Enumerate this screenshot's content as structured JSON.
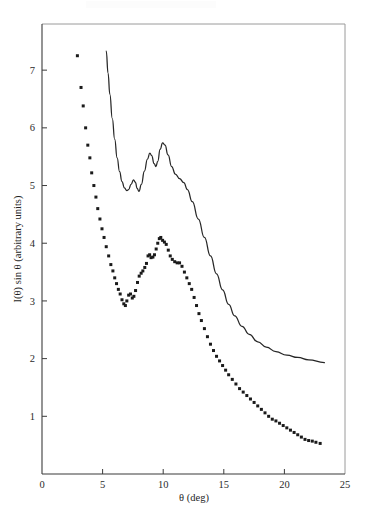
{
  "figure": {
    "background_color": "#ffffff",
    "ink_color": "#1a1a1a",
    "frame_color": "#9a9a9a"
  },
  "chart_data": {
    "type": "scatter",
    "title": "",
    "subtitle": "",
    "xlabel": "θ (deg)",
    "ylabel": "I(θ) sin θ (arbitrary units)",
    "xlim": [
      0,
      25
    ],
    "ylim": [
      0,
      7.8
    ],
    "xticks": [
      0,
      5,
      10,
      15,
      20,
      25
    ],
    "xticklabels": [
      "0",
      "5",
      "10",
      "15",
      "20",
      "25"
    ],
    "yticks": [
      1,
      2,
      3,
      4,
      5,
      6,
      7
    ],
    "yticklabels": [
      "1",
      "2",
      "3",
      "4",
      "5",
      "6",
      "7"
    ],
    "grid": false,
    "legend": null,
    "legend_position": "none",
    "annotations": [],
    "series": [
      {
        "name": "calculated curve",
        "style": "line",
        "marker": "none",
        "color": "#262626",
        "points": [
          [
            5.3,
            7.33
          ],
          [
            5.45,
            6.95
          ],
          [
            5.6,
            6.58
          ],
          [
            5.8,
            6.16
          ],
          [
            6.0,
            5.8
          ],
          [
            6.2,
            5.48
          ],
          [
            6.4,
            5.24
          ],
          [
            6.6,
            5.07
          ],
          [
            6.8,
            4.96
          ],
          [
            7.0,
            4.91
          ],
          [
            7.15,
            4.93
          ],
          [
            7.35,
            5.02
          ],
          [
            7.55,
            5.1
          ],
          [
            7.7,
            5.06
          ],
          [
            7.85,
            4.95
          ],
          [
            8.0,
            4.9
          ],
          [
            8.2,
            5.02
          ],
          [
            8.45,
            5.25
          ],
          [
            8.7,
            5.46
          ],
          [
            8.9,
            5.56
          ],
          [
            9.05,
            5.52
          ],
          [
            9.25,
            5.38
          ],
          [
            9.4,
            5.33
          ],
          [
            9.55,
            5.42
          ],
          [
            9.75,
            5.63
          ],
          [
            9.95,
            5.74
          ],
          [
            10.15,
            5.7
          ],
          [
            10.4,
            5.53
          ],
          [
            10.7,
            5.33
          ],
          [
            11.0,
            5.2
          ],
          [
            11.35,
            5.12
          ],
          [
            11.7,
            5.05
          ],
          [
            12.0,
            4.93
          ],
          [
            12.4,
            4.72
          ],
          [
            12.9,
            4.42
          ],
          [
            13.4,
            4.1
          ],
          [
            13.9,
            3.78
          ],
          [
            14.4,
            3.47
          ],
          [
            14.9,
            3.19
          ],
          [
            15.4,
            2.94
          ],
          [
            15.9,
            2.74
          ],
          [
            16.5,
            2.56
          ],
          [
            17.1,
            2.42
          ],
          [
            17.8,
            2.29
          ],
          [
            18.5,
            2.2
          ],
          [
            19.3,
            2.12
          ],
          [
            20.2,
            2.06
          ],
          [
            21.1,
            2.02
          ],
          [
            22.0,
            1.98
          ],
          [
            23.3,
            1.93
          ]
        ]
      },
      {
        "name": "experimental data",
        "style": "scatter",
        "marker": "square",
        "color": "#1a1a1a",
        "points": [
          [
            2.92,
            7.25
          ],
          [
            3.22,
            6.7
          ],
          [
            3.4,
            6.38
          ],
          [
            3.6,
            6.0
          ],
          [
            3.78,
            5.7
          ],
          [
            3.95,
            5.48
          ],
          [
            4.1,
            5.22
          ],
          [
            4.28,
            5.0
          ],
          [
            4.45,
            4.8
          ],
          [
            4.6,
            4.6
          ],
          [
            4.78,
            4.42
          ],
          [
            4.95,
            4.25
          ],
          [
            5.12,
            4.1
          ],
          [
            5.3,
            3.94
          ],
          [
            5.5,
            3.78
          ],
          [
            5.68,
            3.63
          ],
          [
            5.85,
            3.52
          ],
          [
            6.0,
            3.4
          ],
          [
            6.15,
            3.3
          ],
          [
            6.3,
            3.2
          ],
          [
            6.45,
            3.12
          ],
          [
            6.6,
            3.02
          ],
          [
            6.75,
            2.95
          ],
          [
            6.88,
            2.92
          ],
          [
            7.0,
            3.0
          ],
          [
            7.15,
            3.1
          ],
          [
            7.3,
            3.12
          ],
          [
            7.45,
            3.05
          ],
          [
            7.58,
            3.08
          ],
          [
            7.72,
            3.18
          ],
          [
            7.88,
            3.32
          ],
          [
            8.02,
            3.43
          ],
          [
            8.18,
            3.48
          ],
          [
            8.32,
            3.52
          ],
          [
            8.48,
            3.58
          ],
          [
            8.62,
            3.65
          ],
          [
            8.75,
            3.78
          ],
          [
            8.88,
            3.8
          ],
          [
            9.0,
            3.75
          ],
          [
            9.15,
            3.76
          ],
          [
            9.28,
            3.8
          ],
          [
            9.42,
            3.9
          ],
          [
            9.55,
            4.0
          ],
          [
            9.68,
            4.08
          ],
          [
            9.8,
            4.1
          ],
          [
            9.95,
            4.05
          ],
          [
            10.1,
            4.02
          ],
          [
            10.25,
            3.98
          ],
          [
            10.42,
            3.88
          ],
          [
            10.58,
            3.78
          ],
          [
            10.75,
            3.72
          ],
          [
            10.95,
            3.68
          ],
          [
            11.15,
            3.66
          ],
          [
            11.35,
            3.66
          ],
          [
            11.55,
            3.6
          ],
          [
            11.75,
            3.5
          ],
          [
            11.95,
            3.4
          ],
          [
            12.15,
            3.3
          ],
          [
            12.35,
            3.2
          ],
          [
            12.55,
            3.06
          ],
          [
            12.75,
            2.92
          ],
          [
            12.95,
            2.78
          ],
          [
            13.15,
            2.66
          ],
          [
            13.4,
            2.52
          ],
          [
            13.65,
            2.38
          ],
          [
            13.9,
            2.25
          ],
          [
            14.15,
            2.14
          ],
          [
            14.4,
            2.04
          ],
          [
            14.65,
            1.96
          ],
          [
            14.9,
            1.88
          ],
          [
            15.15,
            1.8
          ],
          [
            15.4,
            1.72
          ],
          [
            15.7,
            1.64
          ],
          [
            16.0,
            1.56
          ],
          [
            16.3,
            1.48
          ],
          [
            16.6,
            1.42
          ],
          [
            16.9,
            1.36
          ],
          [
            17.2,
            1.3
          ],
          [
            17.5,
            1.24
          ],
          [
            17.8,
            1.18
          ],
          [
            18.1,
            1.12
          ],
          [
            18.4,
            1.06
          ],
          [
            18.7,
            1.0
          ],
          [
            19.0,
            0.95
          ],
          [
            19.3,
            0.92
          ],
          [
            19.6,
            0.88
          ],
          [
            19.9,
            0.84
          ],
          [
            20.2,
            0.8
          ],
          [
            20.5,
            0.76
          ],
          [
            20.8,
            0.72
          ],
          [
            21.1,
            0.68
          ],
          [
            21.4,
            0.64
          ],
          [
            21.7,
            0.6
          ],
          [
            22.0,
            0.58
          ],
          [
            22.3,
            0.57
          ],
          [
            22.6,
            0.55
          ],
          [
            22.95,
            0.53
          ]
        ]
      }
    ]
  }
}
